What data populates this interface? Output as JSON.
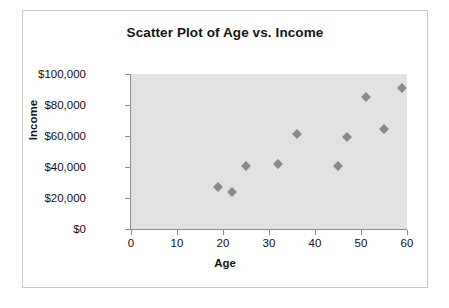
{
  "chart_data": {
    "type": "scatter",
    "title": "Scatter Plot of Age vs. Income",
    "xlabel": "Age",
    "ylabel": "Income",
    "xlim": [
      0,
      60
    ],
    "ylim": [
      0,
      100000
    ],
    "grid": false,
    "legend": null,
    "x_ticks": [
      {
        "value": 0,
        "label": "0"
      },
      {
        "value": 10,
        "label": "10"
      },
      {
        "value": 20,
        "label": "20"
      },
      {
        "value": 30,
        "label": "30"
      },
      {
        "value": 40,
        "label": "40"
      },
      {
        "value": 50,
        "label": "50"
      },
      {
        "value": 60,
        "label": "60"
      }
    ],
    "y_ticks": [
      {
        "value": 0,
        "label": "$0"
      },
      {
        "value": 20000,
        "label": "$20,000"
      },
      {
        "value": 40000,
        "label": "$40,000"
      },
      {
        "value": 60000,
        "label": "$60,000"
      },
      {
        "value": 80000,
        "label": "$80,000"
      },
      {
        "value": 100000,
        "label": "$100,000"
      }
    ],
    "series": [
      {
        "name": "Age vs. Income",
        "marker": "diamond",
        "color": "#8a8a8a",
        "points": [
          {
            "x": 19,
            "y": 27000
          },
          {
            "x": 22,
            "y": 24000
          },
          {
            "x": 25,
            "y": 40500
          },
          {
            "x": 32,
            "y": 42000
          },
          {
            "x": 36,
            "y": 61000
          },
          {
            "x": 45,
            "y": 40500
          },
          {
            "x": 47,
            "y": 59500
          },
          {
            "x": 51,
            "y": 85000
          },
          {
            "x": 55,
            "y": 64500
          },
          {
            "x": 59,
            "y": 91000
          }
        ]
      }
    ],
    "colors": {
      "plot_background": "#e2e2e2",
      "chart_background": "#ffffff",
      "axis": "#8d8d8d",
      "border": "#c9c9c9",
      "text": "#141414"
    }
  }
}
